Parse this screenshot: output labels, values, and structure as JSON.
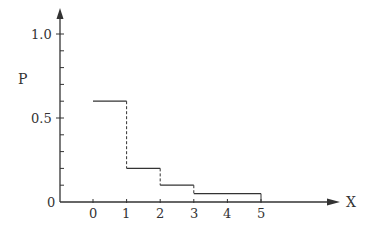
{
  "chart_data": {
    "type": "line",
    "subtype": "step",
    "title": "",
    "xlabel": "X",
    "ylabel": "P",
    "x_ticks": [
      "0",
      "1",
      "2",
      "3",
      "4",
      "5"
    ],
    "y_tick_labels": [
      "0",
      "0.5",
      "1.0"
    ],
    "y_minor_tick_step": 0.1,
    "xlim": [
      -1,
      7.5
    ],
    "ylim": [
      0,
      1.1
    ],
    "grid": false,
    "legend": null,
    "steps": [
      {
        "x_start": 0,
        "x_end": 1,
        "y": 0.6
      },
      {
        "x_start": 1,
        "x_end": 2,
        "y": 0.2
      },
      {
        "x_start": 2,
        "x_end": 3,
        "y": 0.1
      },
      {
        "x_start": 3,
        "x_end": 5,
        "y": 0.05
      }
    ],
    "x": [
      0,
      1,
      2,
      3,
      5
    ],
    "values": [
      0.6,
      0.2,
      0.1,
      0.05,
      0.05
    ],
    "vertical_connectors": "dashed"
  },
  "labels": {
    "y_axis": "P",
    "x_axis": "X",
    "y_ticks": {
      "zero": "0",
      "half": "0.5",
      "one": "1.0"
    },
    "x_ticks": [
      "0",
      "1",
      "2",
      "3",
      "4",
      "5"
    ]
  },
  "colors": {
    "line": "#333333",
    "background": "#ffffff"
  }
}
